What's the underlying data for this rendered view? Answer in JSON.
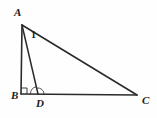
{
  "figure": {
    "type": "geometry-diagram",
    "background_color": "#fefefe",
    "stroke_color": "#2b2b2b",
    "label_color": "#1a1a1a",
    "points": {
      "A": {
        "label": "A",
        "x": 22,
        "y": 25,
        "label_x": 14,
        "label_y": 16
      },
      "B": {
        "label": "B",
        "x": 21,
        "y": 94,
        "label_x": 11,
        "label_y": 99
      },
      "C": {
        "label": "C",
        "x": 137,
        "y": 95,
        "label_x": 142,
        "label_y": 104
      },
      "D": {
        "label": "D",
        "x": 38,
        "y": 94,
        "label_x": 36,
        "label_y": 107
      }
    },
    "segments": [
      {
        "name": "AB",
        "from": "A",
        "to": "B"
      },
      {
        "name": "BC",
        "from": "B",
        "to": "C"
      },
      {
        "name": "AC",
        "from": "A",
        "to": "C"
      },
      {
        "name": "AD",
        "from": "A",
        "to": "D"
      }
    ],
    "segment_labels": [
      {
        "name": "label-1",
        "text": "1",
        "x": 31,
        "y": 38
      }
    ],
    "marks": {
      "right_angle_at": "B",
      "right_angle_size": 6,
      "angle_arcs_at": "D",
      "angle_arc_count": 2
    }
  }
}
